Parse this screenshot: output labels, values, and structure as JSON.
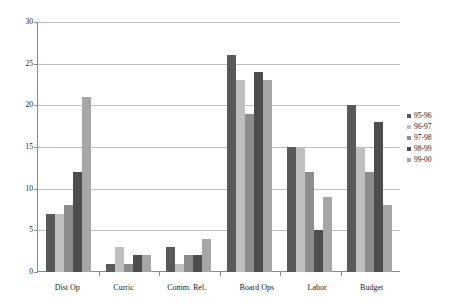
{
  "chart_data": {
    "type": "bar",
    "title": "",
    "xlabel": "",
    "ylabel": "",
    "ylim": [
      0,
      30
    ],
    "ytick_step": 5,
    "yticks": [
      0,
      5,
      10,
      15,
      20,
      25,
      30
    ],
    "ytick_labels": [
      "0",
      "5",
      "10",
      "15",
      "20",
      "25",
      "30"
    ],
    "grid": true,
    "legend_position": "right",
    "categories": [
      "Dist Op",
      "Curric",
      "Comm. Rel.",
      "Board Ops",
      "Labor",
      "Budget"
    ],
    "series": [
      {
        "name": "95-96",
        "color": "#595959",
        "values": [
          7,
          1,
          3,
          26,
          15,
          20
        ]
      },
      {
        "name": "96-97",
        "color": "#bfbfbf",
        "values": [
          7,
          3,
          1,
          23,
          15,
          15
        ]
      },
      {
        "name": "97-98",
        "color": "#8c8c8c",
        "values": [
          8,
          1,
          2,
          19,
          12,
          12
        ]
      },
      {
        "name": "98-99",
        "color": "#4d4d4d",
        "values": [
          12,
          2,
          2,
          24,
          5,
          18
        ]
      },
      {
        "name": "99-00",
        "color": "#a6a6a6",
        "values": [
          21,
          2,
          4,
          23,
          9,
          8
        ]
      }
    ]
  },
  "colors": {
    "axis": "#8a8a8a",
    "grid": "#bfbfbf",
    "text": "#1a1a1a",
    "background": "#ffffff"
  }
}
